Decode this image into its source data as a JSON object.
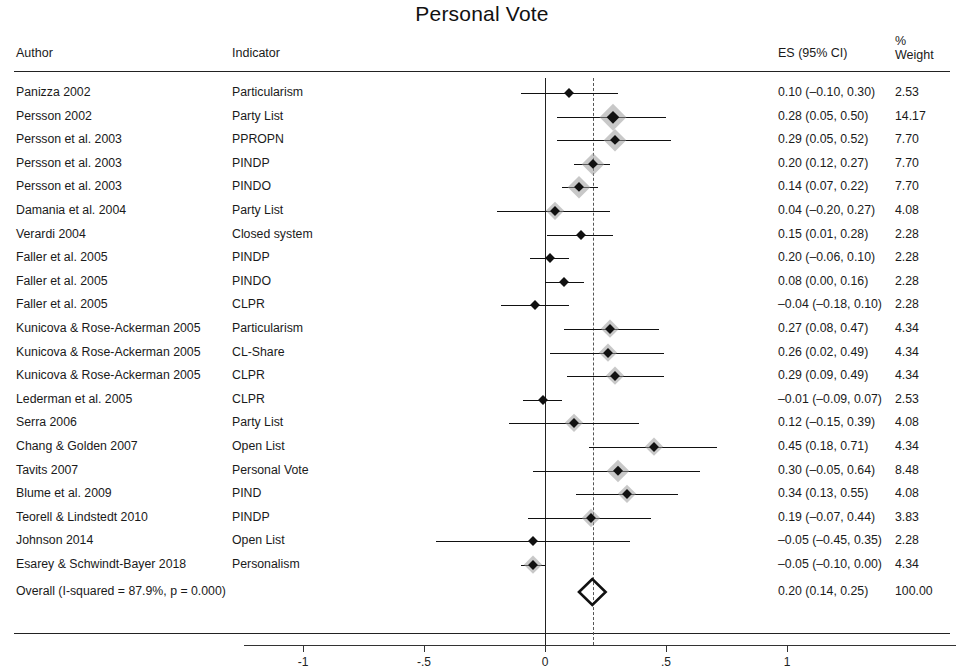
{
  "title": "Personal Vote",
  "headers": {
    "author": "Author",
    "indicator": "Indicator",
    "es": "ES (95% CI)",
    "weight_pct": "%",
    "weight": "Weight"
  },
  "chart_data": {
    "type": "forest",
    "title": "Personal Vote",
    "xlabel": "",
    "ylabel": "",
    "xlim": [
      -1.35,
      1.35
    ],
    "xticks": [
      -1,
      -0.5,
      0,
      0.5,
      1
    ],
    "xtick_labels": [
      "-1",
      "-.5",
      "0",
      ".5",
      "1"
    ],
    "grid": false,
    "null_line": 0,
    "pooled_line": 0.2,
    "columns": [
      "Author",
      "Indicator",
      "ES (95% CI)",
      "% Weight"
    ],
    "rows": [
      {
        "author": "Panizza 2002",
        "indicator": "Particularism",
        "es_label": "0.10 (–0.10, 0.30)",
        "weight_label": "2.53",
        "es": 0.1,
        "lo": -0.1,
        "hi": 0.3,
        "weight": 2.53
      },
      {
        "author": "Persson 2002",
        "indicator": "Party List",
        "es_label": "0.28 (0.05, 0.50)",
        "weight_label": "14.17",
        "es": 0.28,
        "lo": 0.05,
        "hi": 0.5,
        "weight": 14.17
      },
      {
        "author": "Persson et al. 2003",
        "indicator": "PPROPN",
        "es_label": "0.29 (0.05, 0.52)",
        "weight_label": "7.70",
        "es": 0.29,
        "lo": 0.05,
        "hi": 0.52,
        "weight": 7.7
      },
      {
        "author": "Persson et al. 2003",
        "indicator": "PINDP",
        "es_label": "0.20 (0.12, 0.27)",
        "weight_label": "7.70",
        "es": 0.2,
        "lo": 0.12,
        "hi": 0.27,
        "weight": 7.7
      },
      {
        "author": "Persson et al. 2003",
        "indicator": "PINDO",
        "es_label": "0.14 (0.07, 0.22)",
        "weight_label": "7.70",
        "es": 0.14,
        "lo": 0.07,
        "hi": 0.22,
        "weight": 7.7
      },
      {
        "author": "Damania et al. 2004",
        "indicator": "Party List",
        "es_label": "0.04 (–0.20, 0.27)",
        "weight_label": "4.08",
        "es": 0.04,
        "lo": -0.2,
        "hi": 0.27,
        "weight": 4.08
      },
      {
        "author": "Verardi 2004",
        "indicator": "Closed system",
        "es_label": "0.15 (0.01, 0.28)",
        "weight_label": "2.28",
        "es": 0.15,
        "lo": 0.01,
        "hi": 0.28,
        "weight": 2.28
      },
      {
        "author": "Faller et al. 2005",
        "indicator": "PINDP",
        "es_label": "0.20 (–0.06, 0.10)",
        "weight_label": "2.28",
        "es": 0.02,
        "lo": -0.06,
        "hi": 0.1,
        "weight": 2.28
      },
      {
        "author": "Faller et al. 2005",
        "indicator": "PINDO",
        "es_label": "0.08 (0.00, 0.16)",
        "weight_label": "2.28",
        "es": 0.08,
        "lo": 0.0,
        "hi": 0.16,
        "weight": 2.28
      },
      {
        "author": "Faller et al. 2005",
        "indicator": "CLPR",
        "es_label": "–0.04 (–0.18, 0.10)",
        "weight_label": "2.28",
        "es": -0.04,
        "lo": -0.18,
        "hi": 0.1,
        "weight": 2.28
      },
      {
        "author": "Kunicova & Rose-Ackerman 2005",
        "indicator": "Particularism",
        "es_label": "0.27 (0.08, 0.47)",
        "weight_label": "4.34",
        "es": 0.27,
        "lo": 0.08,
        "hi": 0.47,
        "weight": 4.34
      },
      {
        "author": "Kunicova & Rose-Ackerman 2005",
        "indicator": "CL-Share",
        "es_label": "0.26 (0.02, 0.49)",
        "weight_label": "4.34",
        "es": 0.26,
        "lo": 0.02,
        "hi": 0.49,
        "weight": 4.34
      },
      {
        "author": "Kunicova & Rose-Ackerman 2005",
        "indicator": "CLPR",
        "es_label": "0.29 (0.09, 0.49)",
        "weight_label": "4.34",
        "es": 0.29,
        "lo": 0.09,
        "hi": 0.49,
        "weight": 4.34
      },
      {
        "author": "Lederman et al. 2005",
        "indicator": "CLPR",
        "es_label": "–0.01 (–0.09, 0.07)",
        "weight_label": "2.53",
        "es": -0.01,
        "lo": -0.09,
        "hi": 0.07,
        "weight": 2.53
      },
      {
        "author": "Serra 2006",
        "indicator": "Party List",
        "es_label": "0.12 (–0.15, 0.39)",
        "weight_label": "4.08",
        "es": 0.12,
        "lo": -0.15,
        "hi": 0.39,
        "weight": 4.08
      },
      {
        "author": "Chang & Golden 2007",
        "indicator": "Open List",
        "es_label": "0.45 (0.18, 0.71)",
        "weight_label": "4.34",
        "es": 0.45,
        "lo": 0.18,
        "hi": 0.71,
        "weight": 4.34
      },
      {
        "author": "Tavits 2007",
        "indicator": "Personal Vote",
        "es_label": "0.30 (–0.05, 0.64)",
        "weight_label": "8.48",
        "es": 0.3,
        "lo": -0.05,
        "hi": 0.64,
        "weight": 8.48
      },
      {
        "author": "Blume et al. 2009",
        "indicator": "PIND",
        "es_label": "0.34 (0.13, 0.55)",
        "weight_label": "4.08",
        "es": 0.34,
        "lo": 0.13,
        "hi": 0.55,
        "weight": 4.08
      },
      {
        "author": "Teorell & Lindstedt 2010",
        "indicator": "PINDP",
        "es_label": "0.19 (–0.07, 0.44)",
        "weight_label": "3.83",
        "es": 0.19,
        "lo": -0.07,
        "hi": 0.44,
        "weight": 3.83
      },
      {
        "author": "Johnson 2014",
        "indicator": "Open List",
        "es_label": "–0.05 (–0.45, 0.35)",
        "weight_label": "2.28",
        "es": -0.05,
        "lo": -0.45,
        "hi": 0.35,
        "weight": 2.28
      },
      {
        "author": "Esarey & Schwindt-Bayer 2018",
        "indicator": "Personalism",
        "es_label": "–0.05 (–0.10, 0.00)",
        "weight_label": "4.34",
        "es": -0.05,
        "lo": -0.1,
        "hi": 0.0,
        "weight": 4.34
      }
    ],
    "overall": {
      "author": "Overall (I-squared = 87.9%, p = 0.000)",
      "indicator": "",
      "es_label": "0.20 (0.14, 0.25)",
      "weight_label": "100.00",
      "es": 0.2,
      "lo": 0.14,
      "hi": 0.25
    }
  },
  "colors": {
    "marker": "#111111",
    "halo": "#9a9a9a",
    "axis": "#333333",
    "pooled_line": "#555555"
  }
}
